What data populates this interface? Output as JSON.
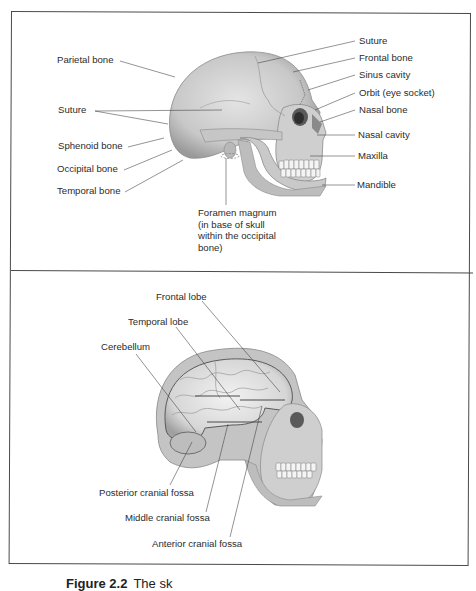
{
  "panel_top": {
    "title": "Lateral view of skull",
    "labels": {
      "parietal_bone": "Parietal bone",
      "suture_left": "Suture",
      "sphenoid_bone": "Sphenoid bone",
      "occipital_bone": "Occipital bone",
      "temporal_bone": "Temporal bone",
      "suture_right": "Suture",
      "frontal_bone": "Frontal bone",
      "sinus_cavity": "Sinus cavity",
      "orbit": "Orbit (eye socket)",
      "nasal_bone": "Nasal bone",
      "nasal_cavity": "Nasal cavity",
      "maxilla": "Maxilla",
      "mandible": "Mandible",
      "foramen_line1": "Foramen magnum",
      "foramen_line2": "(in base of skull",
      "foramen_line3": "within the occipital",
      "foramen_line4": "bone)"
    }
  },
  "panel_bottom": {
    "title": "Brain within skull",
    "labels": {
      "frontal_lobe": "Frontal lobe",
      "temporal_lobe": "Temporal lobe",
      "cerebellum": "Cerebellum",
      "posterior_fossa": "Posterior cranial fossa",
      "middle_fossa": "Middle cranial fossa",
      "anterior_fossa": "Anterior cranial fossa"
    }
  },
  "caption": {
    "figure": "Figure 2.2",
    "text": "The sk"
  },
  "colors": {
    "bone": "#d4d4d4",
    "bone_dark": "#a8a8a8",
    "line": "#3a3a3a",
    "frame": "#4a4a4a"
  }
}
